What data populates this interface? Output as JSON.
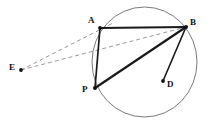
{
  "figure": {
    "kind": "circle-geometry-diagram",
    "width": 211,
    "height": 126,
    "background_color": "#ffffff",
    "stroke_color": "#1a1a1a",
    "circle_color": "#6b6b6b",
    "dashed_color": "#8c8c8c"
  },
  "points": [
    {
      "id": "A",
      "label": "A",
      "x": 100,
      "y": 28,
      "label_x": 88,
      "label_y": 16
    },
    {
      "id": "B",
      "label": "B",
      "x": 186,
      "y": 27,
      "label_x": 190,
      "label_y": 18
    },
    {
      "id": "E",
      "label": "E",
      "x": 21,
      "y": 70,
      "label_x": 9,
      "label_y": 63
    },
    {
      "id": "P",
      "label": "P",
      "x": 95,
      "y": 88,
      "label_x": 82,
      "label_y": 85
    },
    {
      "id": "D",
      "label": "D",
      "x": 163,
      "y": 81,
      "label_x": 167,
      "label_y": 80
    }
  ],
  "circle": {
    "cx": 144.5,
    "cy": 62,
    "rx": 52.5,
    "ry": 55
  },
  "solid_segments": [
    {
      "name": "segment-AB",
      "from": "A",
      "to": "B",
      "width": 2.1
    },
    {
      "name": "segment-AP",
      "from": "A",
      "to": "P",
      "width": 1.8
    },
    {
      "name": "segment-PB",
      "from": "P",
      "to": "B",
      "width": 2.1
    },
    {
      "name": "segment-BD",
      "from": "B",
      "to": "D",
      "width": 1.6
    }
  ],
  "dashed_segments": [
    {
      "name": "segment-EA",
      "from": "E",
      "to": "A",
      "width": 0.9
    },
    {
      "name": "segment-EB",
      "from": "E",
      "to": "B",
      "width": 0.9
    }
  ]
}
